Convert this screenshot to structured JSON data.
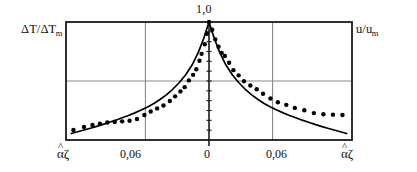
{
  "figure": {
    "left_axis_label": "ΔT/ΔT",
    "left_axis_sub": "m",
    "right_axis_label": "u/u",
    "right_axis_sub": "m",
    "peak_label": "1,0",
    "tick_left_end": "αζ",
    "tick_left_006": "0,06",
    "tick_zero": "0",
    "tick_right_006": "0,06",
    "tick_right_end": "αζ",
    "hat": "^",
    "curve_color": "#000000",
    "point_color": "#000000",
    "frame_color": "#1a1a1a",
    "grid_color": "#8a8a8a"
  },
  "chart_data": {
    "type": "line",
    "title": "",
    "subtitle": "",
    "xlabel": "",
    "ylabel": "ΔT/ΔTm   ·   u/um",
    "xlim": [
      -0.135,
      0.135
    ],
    "ylim": [
      0.0,
      1.0
    ],
    "grid": true,
    "grid_x": [
      -0.06,
      0.0,
      0.06
    ],
    "grid_y": [
      0.5
    ],
    "legend": "none",
    "xticks": [
      -0.135,
      -0.06,
      0.0,
      0.06,
      0.135
    ],
    "xticklabels": [
      "αζ",
      "0,06",
      "0",
      "0,06",
      "αζ"
    ],
    "yticks": [
      1.0
    ],
    "yticklabels": [
      "1,0"
    ],
    "annotations": [
      {
        "text": "1,0",
        "x": 0.0,
        "y": 1.0,
        "position": "above-peak"
      },
      {
        "text": "ΔT/ΔTm",
        "position": "top-left-outside"
      },
      {
        "text": "u/um",
        "position": "top-right-outside"
      }
    ],
    "series": [
      {
        "name": "theoretical curve",
        "type": "line",
        "x": [
          -0.13,
          -0.124,
          -0.118,
          -0.112,
          -0.106,
          -0.1,
          -0.094,
          -0.088,
          -0.082,
          -0.076,
          -0.07,
          -0.064,
          -0.058,
          -0.052,
          -0.046,
          -0.04,
          -0.034,
          -0.028,
          -0.022,
          -0.016,
          -0.01,
          -0.005,
          0.0,
          0.005,
          0.01,
          0.016,
          0.022,
          0.028,
          0.034,
          0.04,
          0.046,
          0.052,
          0.058,
          0.064,
          0.07,
          0.076,
          0.082,
          0.088,
          0.094,
          0.1,
          0.106,
          0.112,
          0.118,
          0.124,
          0.13
        ],
        "y": [
          0.055,
          0.07,
          0.085,
          0.1,
          0.115,
          0.132,
          0.15,
          0.168,
          0.188,
          0.208,
          0.23,
          0.254,
          0.28,
          0.31,
          0.345,
          0.385,
          0.432,
          0.487,
          0.553,
          0.635,
          0.745,
          0.86,
          1.0,
          0.86,
          0.745,
          0.635,
          0.553,
          0.487,
          0.432,
          0.385,
          0.345,
          0.31,
          0.28,
          0.254,
          0.23,
          0.208,
          0.188,
          0.168,
          0.15,
          0.132,
          0.115,
          0.1,
          0.085,
          0.07,
          0.055
        ]
      },
      {
        "name": "experimental points",
        "type": "scatter",
        "x": [
          -0.128,
          -0.118,
          -0.11,
          -0.103,
          -0.096,
          -0.089,
          -0.082,
          -0.075,
          -0.068,
          -0.061,
          -0.055,
          -0.049,
          -0.043,
          -0.037,
          -0.032,
          -0.027,
          -0.023,
          -0.019,
          -0.015,
          -0.012,
          -0.009,
          -0.007,
          -0.004,
          -0.002,
          0.0,
          0.003,
          0.006,
          0.009,
          0.012,
          0.015,
          0.019,
          0.023,
          0.028,
          0.033,
          0.039,
          0.045,
          0.051,
          0.058,
          0.065,
          0.073,
          0.081,
          0.09,
          0.099,
          0.108,
          0.117,
          0.126
        ],
        "y": [
          0.085,
          0.11,
          0.128,
          0.138,
          0.148,
          0.152,
          0.158,
          0.163,
          0.178,
          0.212,
          0.242,
          0.268,
          0.292,
          0.33,
          0.37,
          0.412,
          0.448,
          0.505,
          0.552,
          0.6,
          0.672,
          0.73,
          0.812,
          0.9,
          1.0,
          0.935,
          0.852,
          0.79,
          0.738,
          0.712,
          0.655,
          0.592,
          0.548,
          0.498,
          0.462,
          0.43,
          0.392,
          0.352,
          0.32,
          0.298,
          0.272,
          0.252,
          0.228,
          0.218,
          0.215,
          0.212
        ]
      }
    ]
  },
  "plot_geometry": {
    "frame_left": 66,
    "frame_right": 352,
    "frame_top": 22,
    "frame_bottom": 140,
    "center_x": 209,
    "grid_left_x": 136,
    "grid_right_x": 283,
    "grid_mid_y": 81
  }
}
